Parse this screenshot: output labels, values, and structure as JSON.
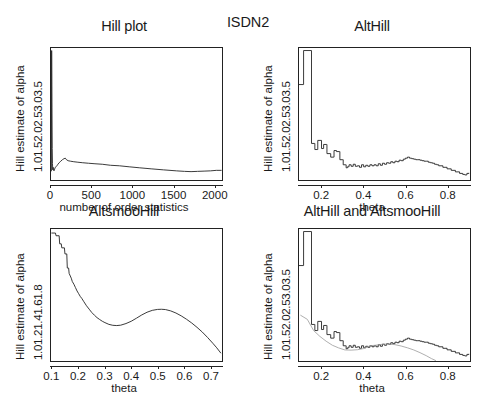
{
  "figure": {
    "overall_title": "ISDN2",
    "background_color": "#ffffff",
    "line_color": "#222222"
  },
  "chart_data": [
    {
      "id": "hill-plot",
      "type": "line",
      "title": "Hill plot",
      "xlabel": "number of order statistics",
      "ylabel": "Hill estimate of alpha",
      "xlim": [
        0,
        2100
      ],
      "ylim": [
        1.0,
        3.6
      ],
      "xticks": [
        "0",
        "500",
        "1000",
        "1500",
        "2000"
      ],
      "xtick_values": [
        0,
        500,
        1000,
        1500,
        2000
      ],
      "yticks": [
        "1.0",
        "1.5",
        "2.0",
        "2.5",
        "3.0",
        "3.5"
      ],
      "ytick_values": [
        1.0,
        1.5,
        2.0,
        2.5,
        3.0,
        3.5
      ],
      "grid": false,
      "legend": "none",
      "x": [
        5,
        8,
        12,
        15,
        18,
        22,
        26,
        30,
        36,
        42,
        50,
        60,
        72,
        85,
        100,
        120,
        140,
        160,
        175,
        190,
        210,
        240,
        280,
        330,
        390,
        460,
        540,
        630,
        730,
        840,
        960,
        1090,
        1230,
        1380,
        1540,
        1640,
        1720,
        1800,
        1880,
        1960,
        2030,
        2090
      ],
      "y": [
        1.18,
        3.55,
        2.42,
        1.62,
        1.32,
        1.2,
        1.25,
        1.22,
        1.18,
        1.2,
        1.24,
        1.26,
        1.28,
        1.31,
        1.34,
        1.37,
        1.4,
        1.42,
        1.43,
        1.4,
        1.38,
        1.37,
        1.36,
        1.35,
        1.34,
        1.33,
        1.32,
        1.31,
        1.29,
        1.28,
        1.26,
        1.24,
        1.22,
        1.2,
        1.18,
        1.17,
        1.165,
        1.17,
        1.175,
        1.18,
        1.19,
        1.19
      ]
    },
    {
      "id": "alt-hill",
      "type": "line",
      "title": "AltHill",
      "xlabel": "theta",
      "ylabel": "Hill estimate of alpha",
      "xlim": [
        0.09,
        0.91
      ],
      "ylim": [
        1.0,
        3.6
      ],
      "xticks": [
        "0.2",
        "0.4",
        "0.6",
        "0.8"
      ],
      "xtick_values": [
        0.2,
        0.4,
        0.6,
        0.8
      ],
      "yticks": [
        "1.0",
        "1.5",
        "2.0",
        "2.5",
        "3.0",
        "3.5"
      ],
      "ytick_values": [
        1.0,
        1.5,
        2.0,
        2.5,
        3.0,
        3.5
      ],
      "grid": false,
      "legend": "none",
      "step": true,
      "x": [
        0.09,
        0.11,
        0.112,
        0.148,
        0.15,
        0.163,
        0.166,
        0.178,
        0.18,
        0.196,
        0.198,
        0.206,
        0.208,
        0.222,
        0.224,
        0.24,
        0.242,
        0.256,
        0.258,
        0.268,
        0.27,
        0.284,
        0.286,
        0.3,
        0.302,
        0.312,
        0.316,
        0.322,
        0.33,
        0.34,
        0.35,
        0.36,
        0.37,
        0.38,
        0.39,
        0.4,
        0.41,
        0.42,
        0.43,
        0.44,
        0.45,
        0.46,
        0.47,
        0.48,
        0.49,
        0.5,
        0.51,
        0.52,
        0.53,
        0.54,
        0.55,
        0.56,
        0.57,
        0.58,
        0.59,
        0.6,
        0.61,
        0.62,
        0.63,
        0.64,
        0.65,
        0.66,
        0.67,
        0.68,
        0.69,
        0.7,
        0.71,
        0.72,
        0.73,
        0.74,
        0.75,
        0.76,
        0.78,
        0.8,
        0.82,
        0.84,
        0.86,
        0.875,
        0.885,
        0.895,
        0.905
      ],
      "y": [
        2.88,
        2.88,
        3.55,
        3.55,
        1.72,
        1.72,
        1.6,
        1.6,
        1.78,
        1.78,
        1.62,
        1.62,
        1.7,
        1.7,
        1.52,
        1.52,
        1.45,
        1.45,
        1.58,
        1.58,
        1.56,
        1.56,
        1.4,
        1.4,
        1.3,
        1.3,
        1.24,
        1.26,
        1.3,
        1.27,
        1.31,
        1.27,
        1.28,
        1.25,
        1.3,
        1.26,
        1.29,
        1.27,
        1.3,
        1.28,
        1.3,
        1.28,
        1.32,
        1.29,
        1.33,
        1.31,
        1.34,
        1.33,
        1.36,
        1.34,
        1.37,
        1.36,
        1.39,
        1.38,
        1.41,
        1.43,
        1.45,
        1.43,
        1.42,
        1.41,
        1.4,
        1.4,
        1.39,
        1.38,
        1.37,
        1.37,
        1.35,
        1.34,
        1.33,
        1.31,
        1.3,
        1.28,
        1.25,
        1.22,
        1.19,
        1.16,
        1.13,
        1.11,
        1.1,
        1.13,
        1.14
      ]
    },
    {
      "id": "altsmoo-hill",
      "type": "line",
      "title": "AltsmooHill",
      "xlabel": "theta",
      "ylabel": "Hill estimate of alpha",
      "xlim": [
        0.095,
        0.745
      ],
      "ylim": [
        0.95,
        1.93
      ],
      "xticks": [
        "0.1",
        "0.2",
        "0.3",
        "0.4",
        "0.5",
        "0.6",
        "0.7"
      ],
      "xtick_values": [
        0.1,
        0.2,
        0.3,
        0.4,
        0.5,
        0.6,
        0.7
      ],
      "yticks": [
        "1.0",
        "1.2",
        "1.4",
        "1.6",
        "1.8"
      ],
      "ytick_values": [
        1.0,
        1.2,
        1.4,
        1.6,
        1.8
      ],
      "grid": false,
      "legend": "none",
      "x": [
        0.098,
        0.112,
        0.114,
        0.126,
        0.128,
        0.134,
        0.136,
        0.146,
        0.148,
        0.155,
        0.157,
        0.162,
        0.164,
        0.172,
        0.176,
        0.182,
        0.188,
        0.194,
        0.2,
        0.206,
        0.212,
        0.22,
        0.23,
        0.24,
        0.25,
        0.26,
        0.27,
        0.28,
        0.29,
        0.3,
        0.315,
        0.33,
        0.345,
        0.36,
        0.38,
        0.4,
        0.42,
        0.44,
        0.46,
        0.48,
        0.5,
        0.515,
        0.53,
        0.55,
        0.57,
        0.59,
        0.61,
        0.63,
        0.65,
        0.67,
        0.69,
        0.71,
        0.725,
        0.74
      ],
      "y": [
        1.9,
        1.9,
        1.88,
        1.88,
        1.82,
        1.82,
        1.79,
        1.79,
        1.745,
        1.745,
        1.64,
        1.64,
        1.6,
        1.565,
        1.54,
        1.52,
        1.495,
        1.47,
        1.45,
        1.43,
        1.415,
        1.39,
        1.36,
        1.335,
        1.31,
        1.29,
        1.272,
        1.258,
        1.245,
        1.235,
        1.222,
        1.215,
        1.213,
        1.216,
        1.228,
        1.245,
        1.268,
        1.292,
        1.312,
        1.326,
        1.333,
        1.334,
        1.332,
        1.322,
        1.306,
        1.285,
        1.26,
        1.232,
        1.2,
        1.165,
        1.125,
        1.082,
        1.048,
        1.01
      ]
    },
    {
      "id": "alt-hill-and-altsmoo-hill",
      "type": "line",
      "title": "AltHill and AltsmooHill",
      "xlabel": "theta",
      "ylabel": "Hill estimate of alpha",
      "xlim": [
        0.09,
        0.91
      ],
      "ylim": [
        1.0,
        3.6
      ],
      "xticks": [
        "0.2",
        "0.4",
        "0.6",
        "0.8"
      ],
      "xtick_values": [
        0.2,
        0.4,
        0.6,
        0.8
      ],
      "yticks": [
        "1.0",
        "1.5",
        "2.0",
        "2.5",
        "3.0",
        "3.5"
      ],
      "ytick_values": [
        1.0,
        1.5,
        2.0,
        2.5,
        3.0,
        3.5
      ],
      "grid": false,
      "legend": "none",
      "series": [
        {
          "name": "AltHill",
          "step": true,
          "x": [
            0.09,
            0.11,
            0.112,
            0.148,
            0.15,
            0.163,
            0.166,
            0.178,
            0.18,
            0.196,
            0.198,
            0.206,
            0.208,
            0.222,
            0.224,
            0.24,
            0.242,
            0.256,
            0.258,
            0.268,
            0.27,
            0.284,
            0.286,
            0.3,
            0.302,
            0.312,
            0.316,
            0.322,
            0.33,
            0.34,
            0.35,
            0.36,
            0.37,
            0.38,
            0.39,
            0.4,
            0.41,
            0.42,
            0.43,
            0.44,
            0.45,
            0.46,
            0.47,
            0.48,
            0.49,
            0.5,
            0.51,
            0.52,
            0.53,
            0.54,
            0.55,
            0.56,
            0.57,
            0.58,
            0.59,
            0.6,
            0.61,
            0.62,
            0.63,
            0.64,
            0.65,
            0.66,
            0.67,
            0.68,
            0.69,
            0.7,
            0.71,
            0.72,
            0.73,
            0.74,
            0.75,
            0.76,
            0.78,
            0.8,
            0.82,
            0.84,
            0.86,
            0.875,
            0.885,
            0.895,
            0.905
          ],
          "y": [
            2.88,
            2.88,
            3.55,
            3.55,
            1.72,
            1.72,
            1.6,
            1.6,
            1.78,
            1.78,
            1.62,
            1.62,
            1.7,
            1.7,
            1.52,
            1.52,
            1.45,
            1.45,
            1.58,
            1.58,
            1.56,
            1.56,
            1.4,
            1.4,
            1.3,
            1.3,
            1.24,
            1.26,
            1.3,
            1.27,
            1.31,
            1.27,
            1.28,
            1.25,
            1.3,
            1.26,
            1.29,
            1.27,
            1.3,
            1.28,
            1.3,
            1.28,
            1.32,
            1.29,
            1.33,
            1.31,
            1.34,
            1.33,
            1.36,
            1.34,
            1.37,
            1.36,
            1.39,
            1.38,
            1.41,
            1.43,
            1.45,
            1.43,
            1.42,
            1.41,
            1.4,
            1.4,
            1.39,
            1.38,
            1.37,
            1.37,
            1.35,
            1.34,
            1.33,
            1.31,
            1.3,
            1.28,
            1.25,
            1.22,
            1.19,
            1.16,
            1.13,
            1.11,
            1.1,
            1.13,
            1.14
          ]
        },
        {
          "name": "AltsmooHill",
          "step": false,
          "x": [
            0.098,
            0.13,
            0.16,
            0.19,
            0.22,
            0.25,
            0.28,
            0.31,
            0.34,
            0.37,
            0.4,
            0.43,
            0.46,
            0.49,
            0.52,
            0.55,
            0.58,
            0.61,
            0.64,
            0.67,
            0.7,
            0.725,
            0.745
          ],
          "y": [
            1.9,
            1.82,
            1.6,
            1.485,
            1.39,
            1.31,
            1.258,
            1.218,
            1.214,
            1.222,
            1.245,
            1.3,
            1.312,
            1.33,
            1.334,
            1.322,
            1.295,
            1.26,
            1.218,
            1.165,
            1.105,
            1.048,
            1.01
          ]
        }
      ]
    }
  ]
}
